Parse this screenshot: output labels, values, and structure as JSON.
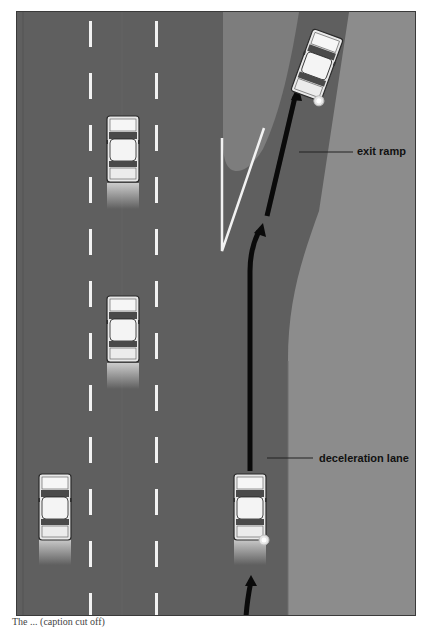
{
  "diagram": {
    "labels": {
      "exit_ramp": "exit ramp",
      "deceleration_lane": "deceleration lane"
    },
    "caption": "The ... (caption cut off)",
    "colors": {
      "road": "#5f5f5f",
      "ramp_surface": "#666666",
      "grass_area": "#8c8c8c",
      "gore_area": "#7d7d7d",
      "lane_marking": "#f2f2f2",
      "path_arrow": "#0a0a0a",
      "frame_border": "#3a3a3a"
    },
    "cars": [
      {
        "id": "car-lane2-top",
        "lane": 2,
        "signal": false
      },
      {
        "id": "car-lane2-middle",
        "lane": 2,
        "signal": false
      },
      {
        "id": "car-lane1-bottom",
        "lane": 1,
        "signal": false
      },
      {
        "id": "car-deceleration-lane",
        "lane": "deceleration",
        "signal": "right"
      },
      {
        "id": "car-exit-ramp",
        "lane": "exit-ramp",
        "signal": "right"
      }
    ]
  }
}
